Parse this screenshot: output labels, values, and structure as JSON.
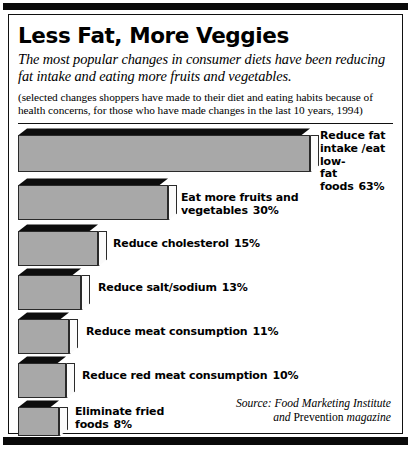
{
  "header": {
    "title": "Less Fat, More Veggies",
    "subtitle": "The most popular changes in consumer diets have been reducing fat intake and eating more fruits and vegetables.",
    "note": "(selected changes shoppers have made to their diet and eating habits because of health concerns, for those who have made changes in the last 10 years, 1994)"
  },
  "source": {
    "line1": "Source: Food Marketing Institute",
    "line2_pre": "and ",
    "line2_roman": "Prevention",
    "line2_post": " magazine"
  },
  "colors": {
    "bar_face": "#a8a8a8",
    "bar_top": "#0d0d0d",
    "bar_side": "#fbfbfb",
    "outline": "#2a2a2a",
    "band": "#0a0a0a",
    "background": "#ffffff"
  },
  "chart_data": {
    "type": "bar",
    "orientation": "horizontal",
    "title": "Less Fat, More Veggies",
    "subtitle": "The most popular changes in consumer diets have been reducing fat intake and eating more fruits and vegetables.",
    "note": "(selected changes shoppers have made to their diet and eating habits because of health concerns, for those who have made changes in the last 10 years, 1994)",
    "xlabel": "",
    "ylabel": "",
    "unit": "%",
    "grid": false,
    "legend": false,
    "xlim": [
      0,
      63
    ],
    "categories": [
      "Reduce fat intake/eat low-fat foods",
      "Eat more fruits and vegetables",
      "Reduce cholesterol",
      "Reduce salt/sodium",
      "Reduce meat consumption",
      "Reduce red meat consumption",
      "Eliminate fried foods"
    ],
    "values": [
      63,
      30,
      15,
      13,
      11,
      10,
      8
    ],
    "bars": [
      {
        "label_text": "Reduce fat\nintake /eat low-\nfat foods",
        "value_text": "63%",
        "value": 63,
        "top": 0,
        "height": 44,
        "width": 292,
        "label_x": 302,
        "label_y": 2,
        "label_align": "top"
      },
      {
        "label_text": "Eat more fruits and vegetables",
        "value_text": "30%",
        "value": 30,
        "top": 50,
        "height": 42,
        "width": 150,
        "label_x": 163,
        "label_y": 64,
        "label_align": "mid"
      },
      {
        "label_text": "Reduce cholesterol",
        "value_text": "15%",
        "value": 15,
        "top": 96,
        "height": 42,
        "width": 80,
        "label_x": 95,
        "label_y": 110,
        "label_align": "mid"
      },
      {
        "label_text": "Reduce salt/sodium",
        "value_text": "13%",
        "value": 13,
        "top": 140,
        "height": 42,
        "width": 63,
        "label_x": 80,
        "label_y": 154,
        "label_align": "mid"
      },
      {
        "label_text": "Reduce meat consumption",
        "value_text": "11%",
        "value": 11,
        "top": 184,
        "height": 42,
        "width": 51,
        "label_x": 68,
        "label_y": 198,
        "label_align": "mid"
      },
      {
        "label_text": "Reduce red meat consumption",
        "value_text": "10%",
        "value": 10,
        "top": 228,
        "height": 42,
        "width": 48,
        "label_x": 64,
        "label_y": 242,
        "label_align": "mid"
      },
      {
        "label_text": "Eliminate fried\nfoods",
        "value_text": "8%",
        "value": 8,
        "top": 272,
        "height": 36,
        "width": 41,
        "label_x": 57,
        "label_y": 278,
        "label_align": "top"
      }
    ]
  }
}
